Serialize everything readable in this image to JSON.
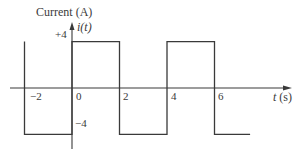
{
  "chart_data": {
    "type": "line",
    "subtype": "step / square wave",
    "title": "",
    "ylabel": "Current (A)",
    "ylabel_symbol": "i(t)",
    "xlabel": "t (s)",
    "x_ticks": [
      "−2",
      "0",
      "2",
      "4",
      "6"
    ],
    "x_tick_values": [
      -2,
      0,
      2,
      4,
      6
    ],
    "y_ticks": [
      "+4",
      "−4"
    ],
    "y_tick_values": [
      4,
      -4
    ],
    "xlim": [
      -3,
      8.5
    ],
    "ylim": [
      -4.5,
      5
    ],
    "grid": false,
    "legend": null,
    "series": [
      {
        "name": "i(t)",
        "points": [
          {
            "x": -2,
            "y": 4
          },
          {
            "x": -2,
            "y": -4
          },
          {
            "x": 0,
            "y": -4
          },
          {
            "x": 0,
            "y": 4
          },
          {
            "x": 2,
            "y": 4
          },
          {
            "x": 2,
            "y": -4
          },
          {
            "x": 4,
            "y": -4
          },
          {
            "x": 4,
            "y": 4
          },
          {
            "x": 6,
            "y": 4
          },
          {
            "x": 6,
            "y": -4
          },
          {
            "x": 7.5,
            "y": -4
          }
        ]
      }
    ],
    "period_s": 4,
    "amplitude_A": 4
  },
  "labels": {
    "y_title": "Current (A)",
    "y_symbol": "i(t)",
    "x_title": "t (s)",
    "tick_neg2": "−2",
    "tick_0": "0",
    "tick_2": "2",
    "tick_4": "4",
    "tick_6": "6",
    "tick_pos4": "+4",
    "tick_neg4": "−4"
  },
  "colors": {
    "line": "#3a3a3a",
    "background": "#ffffff"
  }
}
